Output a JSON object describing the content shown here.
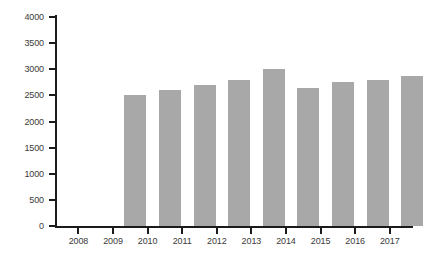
{
  "chart_data": {
    "type": "bar",
    "title": "",
    "xlabel": "",
    "ylabel": "",
    "categories": [
      "2008",
      "2009",
      "2010",
      "2011",
      "2012",
      "2013",
      "2014",
      "2015",
      "2016",
      "2017"
    ],
    "values": [
      2500,
      2600,
      2700,
      2800,
      3000,
      2650,
      2750,
      2800,
      2870,
      2900
    ],
    "ylim": [
      0,
      4000
    ],
    "ytick_values": [
      0,
      500,
      1000,
      1500,
      2000,
      2500,
      3000,
      3500,
      4000
    ],
    "ytick_labels": [
      "0",
      "500",
      "1000",
      "1500",
      "2000",
      "2500",
      "3000",
      "3500",
      "4000"
    ],
    "grid": false,
    "legend": null,
    "series": [
      {
        "name": "",
        "values": [
          2500,
          2600,
          2700,
          2800,
          3000,
          2650,
          2750,
          2800,
          2870,
          2900
        ]
      }
    ],
    "colors": {
      "bar_fill": "#a8a8a8",
      "axis": "#1b1b1b",
      "tick_label": "#3a3a3a",
      "background": "#ffffff"
    }
  }
}
